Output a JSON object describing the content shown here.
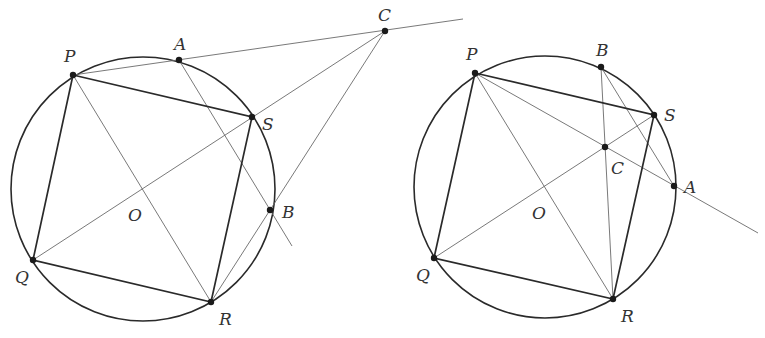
{
  "figures": [
    {
      "name": "left-figure",
      "circle": {
        "cx": 143,
        "cy": 189,
        "r": 132
      },
      "points": {
        "P": {
          "x": 73,
          "y": 75,
          "label": "P",
          "lx": 64,
          "ly": 62
        },
        "A": {
          "x": 179,
          "y": 60,
          "label": "A",
          "lx": 174,
          "ly": 50
        },
        "S": {
          "x": 252,
          "y": 117,
          "label": "S",
          "lx": 262,
          "ly": 130
        },
        "B": {
          "x": 270,
          "y": 210,
          "label": "B",
          "lx": 282,
          "ly": 218
        },
        "R": {
          "x": 211,
          "y": 302,
          "label": "R",
          "lx": 219,
          "ly": 325
        },
        "Q": {
          "x": 33,
          "y": 260,
          "label": "Q",
          "lx": 15,
          "ly": 283
        },
        "C": {
          "x": 385,
          "y": 31,
          "label": "C",
          "lx": 378,
          "ly": 21
        },
        "O": {
          "label": "O",
          "lx": 128,
          "ly": 221
        }
      },
      "square": [
        "P",
        "S",
        "R",
        "Q"
      ],
      "thin_lines": [
        {
          "from": [
            73,
            75
          ],
          "to": [
            463,
            19
          ],
          "desc": "P-A-C line"
        },
        {
          "from": [
            179,
            60
          ],
          "to": [
            292,
            246
          ],
          "desc": "A-B line"
        },
        {
          "from": [
            385,
            31
          ],
          "to": [
            211,
            302
          ],
          "desc": "C-B-R line"
        },
        {
          "from": [
            33,
            260
          ],
          "to": [
            385,
            31
          ],
          "desc": "Q-S-C line"
        },
        {
          "from": [
            73,
            75
          ],
          "to": [
            211,
            302
          ],
          "desc": "P-R diagonal"
        }
      ]
    },
    {
      "name": "right-figure",
      "circle": {
        "cx": 545,
        "cy": 187,
        "r": 131
      },
      "points": {
        "P": {
          "x": 475,
          "y": 73,
          "label": "P",
          "lx": 466,
          "ly": 60
        },
        "B": {
          "x": 601,
          "y": 67,
          "label": "B",
          "lx": 596,
          "ly": 56
        },
        "S": {
          "x": 654,
          "y": 115,
          "label": "S",
          "lx": 664,
          "ly": 121
        },
        "C": {
          "x": 605,
          "y": 147,
          "label": "C",
          "lx": 611,
          "ly": 174
        },
        "A": {
          "x": 674,
          "y": 186,
          "label": "A",
          "lx": 684,
          "ly": 193
        },
        "R": {
          "x": 613,
          "y": 299,
          "label": "R",
          "lx": 621,
          "ly": 322
        },
        "Q": {
          "x": 434,
          "y": 258,
          "label": "Q",
          "lx": 416,
          "ly": 281
        },
        "O": {
          "label": "O",
          "lx": 532,
          "ly": 219
        }
      },
      "square": [
        "P",
        "S",
        "R",
        "Q"
      ],
      "thin_lines": [
        {
          "from": [
            475,
            73
          ],
          "to": [
            758,
            233
          ],
          "desc": "P-C-A line"
        },
        {
          "from": [
            601,
            67
          ],
          "to": [
            613,
            299
          ],
          "desc": "B-C-R line"
        },
        {
          "from": [
            601,
            67
          ],
          "to": [
            674,
            186
          ],
          "desc": "B-A line"
        },
        {
          "from": [
            434,
            258
          ],
          "to": [
            654,
            115
          ],
          "desc": "Q-C-S line"
        },
        {
          "from": [
            475,
            73
          ],
          "to": [
            613,
            299
          ],
          "desc": "P-R diagonal"
        }
      ]
    }
  ]
}
